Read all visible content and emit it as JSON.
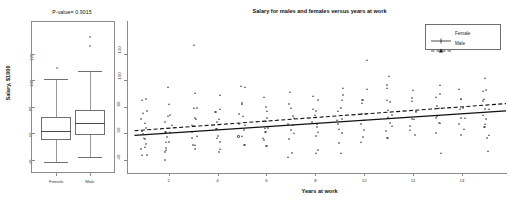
{
  "chart_data": [
    {
      "type": "table",
      "panel": "left-boxplot",
      "title": "P-value= 0.9015",
      "xlabel": "",
      "ylabel": "Salary, $1000",
      "categories": [
        "Female",
        "Male"
      ],
      "ylim": [
        30,
        145
      ],
      "yticks": [
        40,
        60,
        80,
        100,
        120
      ],
      "grid": false,
      "boxes": [
        {
          "name": "Female",
          "min_whisker": 38,
          "q1": 55,
          "median": 62,
          "q3": 72,
          "max_whisker": 101,
          "outliers": [
            110
          ]
        },
        {
          "name": "Male",
          "min_whisker": 42,
          "q1": 59,
          "median": 68,
          "q3": 78,
          "max_whisker": 107,
          "outliers": [
            126,
            133
          ]
        }
      ]
    },
    {
      "type": "scatter",
      "panel": "right-scatter",
      "title": "Salary for males and females versus years at work",
      "xlabel": "Years at work",
      "ylabel": "",
      "xlim": [
        0.5,
        15.8
      ],
      "ylim": [
        30,
        145
      ],
      "xticks": [
        2,
        4,
        6,
        8,
        10,
        12,
        14
      ],
      "yticks": [
        40,
        60,
        80,
        100,
        120
      ],
      "grid": false,
      "legend_position": "top-right",
      "legend": [
        {
          "name": "Female",
          "style": "solid",
          "marker": "circle"
        },
        {
          "name": "Male",
          "style": "dashed",
          "marker": "triangle"
        }
      ],
      "series": [
        {
          "name": "Female",
          "marker": "circle",
          "line": "solid",
          "fit_line": {
            "x": [
              0.6,
              15.8
            ],
            "y": [
              58.5,
              77.0
            ]
          },
          "points": [
            {
              "x": 1,
              "y": 87
            },
            {
              "x": 1,
              "y": 78
            },
            {
              "x": 1,
              "y": 70
            },
            {
              "x": 1,
              "y": 64
            },
            {
              "x": 1,
              "y": 60
            },
            {
              "x": 1,
              "y": 56
            },
            {
              "x": 1,
              "y": 52
            },
            {
              "x": 1,
              "y": 47
            },
            {
              "x": 1,
              "y": 43
            },
            {
              "x": 2,
              "y": 74
            },
            {
              "x": 2,
              "y": 68
            },
            {
              "x": 2,
              "y": 62
            },
            {
              "x": 2,
              "y": 58
            },
            {
              "x": 2,
              "y": 54
            },
            {
              "x": 2,
              "y": 49
            },
            {
              "x": 2,
              "y": 45
            },
            {
              "x": 2,
              "y": 39
            },
            {
              "x": 3,
              "y": 80
            },
            {
              "x": 3,
              "y": 72
            },
            {
              "x": 3,
              "y": 66
            },
            {
              "x": 3,
              "y": 61
            },
            {
              "x": 3,
              "y": 57
            },
            {
              "x": 3,
              "y": 52
            },
            {
              "x": 3,
              "y": 48
            },
            {
              "x": 4,
              "y": 77
            },
            {
              "x": 4,
              "y": 69
            },
            {
              "x": 4,
              "y": 63
            },
            {
              "x": 4,
              "y": 58
            },
            {
              "x": 4,
              "y": 53
            },
            {
              "x": 4,
              "y": 47
            },
            {
              "x": 5,
              "y": 84
            },
            {
              "x": 5,
              "y": 74
            },
            {
              "x": 5,
              "y": 67
            },
            {
              "x": 5,
              "y": 62
            },
            {
              "x": 5,
              "y": 57
            },
            {
              "x": 5,
              "y": 51
            },
            {
              "x": 6,
              "y": 79
            },
            {
              "x": 6,
              "y": 71
            },
            {
              "x": 6,
              "y": 65
            },
            {
              "x": 6,
              "y": 60
            },
            {
              "x": 6,
              "y": 55
            },
            {
              "x": 6,
              "y": 50
            },
            {
              "x": 7,
              "y": 82
            },
            {
              "x": 7,
              "y": 73
            },
            {
              "x": 7,
              "y": 67
            },
            {
              "x": 7,
              "y": 62
            },
            {
              "x": 7,
              "y": 56
            },
            {
              "x": 7,
              "y": 45
            },
            {
              "x": 8,
              "y": 86
            },
            {
              "x": 8,
              "y": 76
            },
            {
              "x": 8,
              "y": 69
            },
            {
              "x": 8,
              "y": 64
            },
            {
              "x": 8,
              "y": 59
            },
            {
              "x": 8,
              "y": 48
            },
            {
              "x": 9,
              "y": 88
            },
            {
              "x": 9,
              "y": 78
            },
            {
              "x": 9,
              "y": 71
            },
            {
              "x": 9,
              "y": 66
            },
            {
              "x": 9,
              "y": 60
            },
            {
              "x": 9,
              "y": 52
            },
            {
              "x": 10,
              "y": 84
            },
            {
              "x": 10,
              "y": 75
            },
            {
              "x": 10,
              "y": 68
            },
            {
              "x": 10,
              "y": 63
            },
            {
              "x": 10,
              "y": 57
            },
            {
              "x": 11,
              "y": 96
            },
            {
              "x": 11,
              "y": 83
            },
            {
              "x": 11,
              "y": 74
            },
            {
              "x": 11,
              "y": 68
            },
            {
              "x": 11,
              "y": 62
            },
            {
              "x": 11,
              "y": 56
            },
            {
              "x": 12,
              "y": 86
            },
            {
              "x": 12,
              "y": 77
            },
            {
              "x": 12,
              "y": 70
            },
            {
              "x": 12,
              "y": 65
            },
            {
              "x": 12,
              "y": 58
            },
            {
              "x": 13,
              "y": 89
            },
            {
              "x": 13,
              "y": 80
            },
            {
              "x": 13,
              "y": 73
            },
            {
              "x": 13,
              "y": 67
            },
            {
              "x": 13,
              "y": 60
            },
            {
              "x": 14,
              "y": 87
            },
            {
              "x": 14,
              "y": 79
            },
            {
              "x": 14,
              "y": 72
            },
            {
              "x": 14,
              "y": 66
            },
            {
              "x": 14,
              "y": 58
            },
            {
              "x": 15,
              "y": 92
            },
            {
              "x": 15,
              "y": 84
            },
            {
              "x": 15,
              "y": 77
            },
            {
              "x": 15,
              "y": 71
            },
            {
              "x": 15,
              "y": 64
            },
            {
              "x": 15,
              "y": 57
            }
          ]
        },
        {
          "name": "Male",
          "marker": "triangle",
          "line": "dashed",
          "fit_line": {
            "x": [
              0.6,
              15.8
            ],
            "y": [
              62.0,
              82.5
            ]
          },
          "points": [
            {
              "x": 1,
              "y": 85
            },
            {
              "x": 1,
              "y": 76
            },
            {
              "x": 1,
              "y": 68
            },
            {
              "x": 1,
              "y": 62
            },
            {
              "x": 1,
              "y": 57
            },
            {
              "x": 1,
              "y": 50
            },
            {
              "x": 1,
              "y": 44
            },
            {
              "x": 2,
              "y": 94
            },
            {
              "x": 2,
              "y": 82
            },
            {
              "x": 2,
              "y": 73
            },
            {
              "x": 2,
              "y": 66
            },
            {
              "x": 2,
              "y": 60
            },
            {
              "x": 2,
              "y": 54
            },
            {
              "x": 2,
              "y": 47
            },
            {
              "x": 3,
              "y": 126
            },
            {
              "x": 3,
              "y": 91
            },
            {
              "x": 3,
              "y": 79
            },
            {
              "x": 3,
              "y": 71
            },
            {
              "x": 3,
              "y": 65
            },
            {
              "x": 3,
              "y": 58
            },
            {
              "x": 3,
              "y": 51
            },
            {
              "x": 4,
              "y": 88
            },
            {
              "x": 4,
              "y": 78
            },
            {
              "x": 4,
              "y": 70
            },
            {
              "x": 4,
              "y": 64
            },
            {
              "x": 4,
              "y": 57
            },
            {
              "x": 4,
              "y": 49
            },
            {
              "x": 5,
              "y": 96
            },
            {
              "x": 5,
              "y": 95
            },
            {
              "x": 5,
              "y": 81
            },
            {
              "x": 5,
              "y": 72
            },
            {
              "x": 5,
              "y": 66
            },
            {
              "x": 5,
              "y": 59
            },
            {
              "x": 6,
              "y": 87
            },
            {
              "x": 6,
              "y": 77
            },
            {
              "x": 6,
              "y": 70
            },
            {
              "x": 6,
              "y": 64
            },
            {
              "x": 6,
              "y": 56
            },
            {
              "x": 7,
              "y": 90
            },
            {
              "x": 7,
              "y": 80
            },
            {
              "x": 7,
              "y": 72
            },
            {
              "x": 7,
              "y": 66
            },
            {
              "x": 7,
              "y": 59
            },
            {
              "x": 7,
              "y": 42
            },
            {
              "x": 8,
              "y": 89
            },
            {
              "x": 8,
              "y": 79
            },
            {
              "x": 8,
              "y": 73
            },
            {
              "x": 8,
              "y": 67
            },
            {
              "x": 8,
              "y": 61
            },
            {
              "x": 8,
              "y": 46
            },
            {
              "x": 9,
              "y": 95
            },
            {
              "x": 9,
              "y": 85
            },
            {
              "x": 9,
              "y": 77
            },
            {
              "x": 9,
              "y": 70
            },
            {
              "x": 9,
              "y": 64
            },
            {
              "x": 9,
              "y": 44
            },
            {
              "x": 10,
              "y": 116
            },
            {
              "x": 10,
              "y": 94
            },
            {
              "x": 10,
              "y": 83
            },
            {
              "x": 10,
              "y": 75
            },
            {
              "x": 10,
              "y": 69
            },
            {
              "x": 10,
              "y": 54
            },
            {
              "x": 11,
              "y": 104
            },
            {
              "x": 11,
              "y": 95
            },
            {
              "x": 11,
              "y": 86
            },
            {
              "x": 11,
              "y": 78
            },
            {
              "x": 11,
              "y": 72
            },
            {
              "x": 11,
              "y": 66
            },
            {
              "x": 12,
              "y": 93
            },
            {
              "x": 12,
              "y": 84
            },
            {
              "x": 12,
              "y": 76
            },
            {
              "x": 12,
              "y": 70
            },
            {
              "x": 12,
              "y": 63
            },
            {
              "x": 13,
              "y": 97
            },
            {
              "x": 13,
              "y": 88
            },
            {
              "x": 13,
              "y": 80
            },
            {
              "x": 13,
              "y": 74
            },
            {
              "x": 13,
              "y": 67
            },
            {
              "x": 13,
              "y": 46
            },
            {
              "x": 14,
              "y": 94
            },
            {
              "x": 14,
              "y": 85
            },
            {
              "x": 14,
              "y": 78
            },
            {
              "x": 14,
              "y": 71
            },
            {
              "x": 14,
              "y": 64
            },
            {
              "x": 15,
              "y": 101
            },
            {
              "x": 15,
              "y": 92
            },
            {
              "x": 15,
              "y": 85
            },
            {
              "x": 15,
              "y": 79
            },
            {
              "x": 15,
              "y": 73
            },
            {
              "x": 15,
              "y": 67
            },
            {
              "x": 15,
              "y": 60
            },
            {
              "x": 15,
              "y": 46
            }
          ]
        }
      ]
    }
  ]
}
